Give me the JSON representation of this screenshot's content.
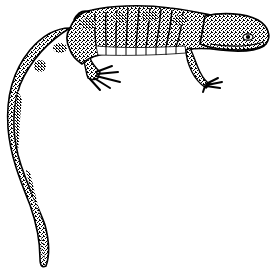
{
  "image": {
    "subject": "salamander",
    "style": "black-and-white stippled line illustration",
    "background": "#ffffff",
    "ink": "#000000",
    "orientation": "head to the right, tail curving down to the bottom-left",
    "parts": [
      "head",
      "eye",
      "body",
      "costal-grooves",
      "belly",
      "front-leg",
      "hind-leg",
      "tail"
    ]
  }
}
